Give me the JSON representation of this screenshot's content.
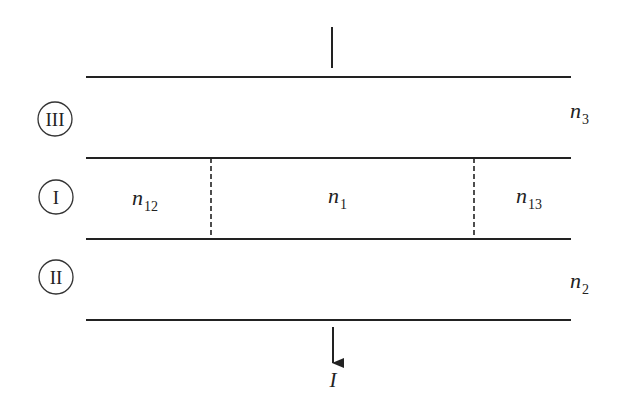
{
  "diagram": {
    "type": "layered waveguide cross-section",
    "regions": [
      {
        "id": "III",
        "label": "III",
        "index_symbol": "n",
        "index_subscript": "3"
      },
      {
        "id": "I",
        "label": "I"
      },
      {
        "id": "II",
        "label": "II",
        "index_symbol": "n",
        "index_subscript": "2"
      }
    ],
    "core_segments": [
      {
        "index_symbol": "n",
        "index_subscript": "12"
      },
      {
        "index_symbol": "n",
        "index_subscript": "1"
      },
      {
        "index_symbol": "n",
        "index_subscript": "13"
      }
    ],
    "output": {
      "label": "I",
      "direction": "down"
    },
    "colors": {
      "line": "#222222",
      "background": "#ffffff"
    }
  }
}
